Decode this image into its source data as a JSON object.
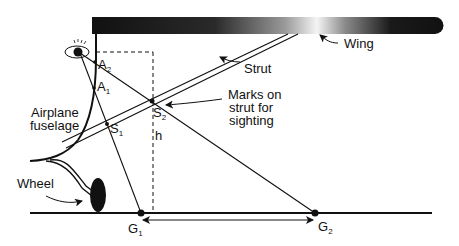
{
  "labels": {
    "wing": "Wing",
    "strut": "Strut",
    "marks_line1": "Marks on",
    "marks_line2": "strut for",
    "marks_line3": "sighting",
    "fuselage_line1": "Airplane",
    "fuselage_line2": "fuselage",
    "wheel": "Wheel",
    "h": "h"
  },
  "points": {
    "A2": {
      "main": "A",
      "sub": "2"
    },
    "A1": {
      "main": "A",
      "sub": "1"
    },
    "S2": {
      "main": "S",
      "sub": "2"
    },
    "S1": {
      "main": "S",
      "sub": "1"
    },
    "G1": {
      "main": "G",
      "sub": "1"
    },
    "G2": {
      "main": "G",
      "sub": "2"
    }
  },
  "colors": {
    "ink": "#111111",
    "wing_dark": "#111111",
    "wing_light": "#f2f2f2",
    "background": "#ffffff"
  }
}
